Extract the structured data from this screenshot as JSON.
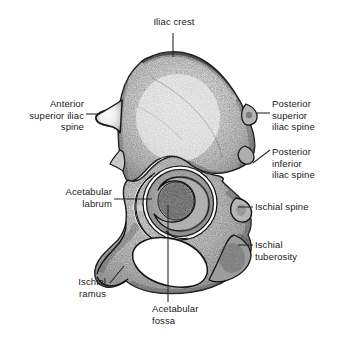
{
  "figure": {
    "background_color": "#ffffff",
    "ink_color": "#1a1a1a",
    "leader_color": "#2a2a2a"
  },
  "labels": {
    "iliac_crest": "Iliac crest",
    "anterior_superior_iliac_spine": "Anterior\nsuperior iliac\nspine",
    "posterior_superior_iliac_spine": "Posterior\nsuperior\niliac spine",
    "posterior_inferior_iliac_spine": "Posterior\ninferior\niliac spine",
    "acetabular_labrum": "Acetabular\nlabrum",
    "ischial_spine": "Ischial spine",
    "ischial_tuberosity": "Ischial\ntuberosity",
    "ischial_ramus": "Ischial\nramus",
    "acetabular_fossa": "Acetabular\nfossa"
  }
}
